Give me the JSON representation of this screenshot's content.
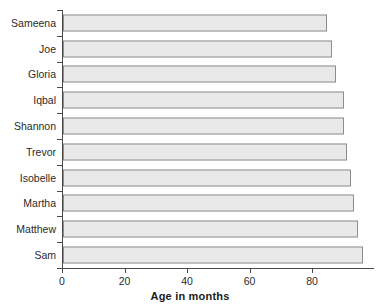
{
  "chart_data": {
    "type": "bar",
    "orientation": "horizontal",
    "title": "",
    "xlabel": "Age in months",
    "ylabel": "",
    "categories": [
      "Sameena",
      "Joe",
      "Gloria",
      "Iqbal",
      "Shannon",
      "Trevor",
      "Isobelle",
      "Martha",
      "Matthew",
      "Sam"
    ],
    "values": [
      84.5,
      86,
      87.5,
      90,
      90,
      91,
      92,
      93,
      94.5,
      96
    ],
    "xticks": [
      0,
      20,
      40,
      60,
      80
    ],
    "xtick_labels": [
      "0",
      "20",
      "40",
      "60",
      "80"
    ],
    "xlim": [
      0,
      99
    ],
    "grid": false,
    "legend": false,
    "bar_fill": "#e9e9e9",
    "bar_border": "#8c8c8c",
    "axis_color": "#4a4a4a",
    "text_color": "#2b2b2b"
  }
}
